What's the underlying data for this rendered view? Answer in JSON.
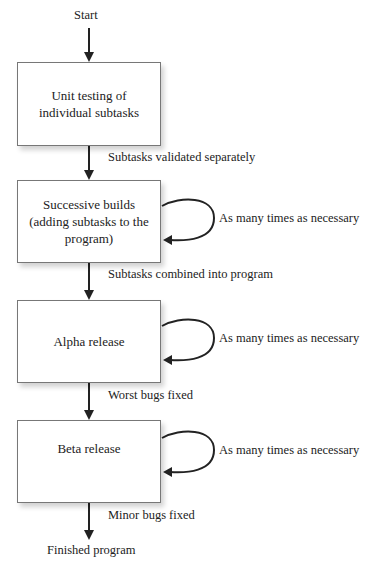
{
  "start_label": "Start",
  "end_label": "Finished program",
  "boxes": [
    {
      "text": "Unit testing of individual subtasks",
      "lines": [
        "Unit testing of",
        "individual subtasks"
      ]
    },
    {
      "text": "Successive builds (adding subtasks to the program)",
      "lines": [
        "Successive builds",
        "(adding subtasks to the",
        "program)"
      ]
    },
    {
      "text": "Alpha release",
      "lines": [
        "Alpha release"
      ]
    },
    {
      "text": "Beta release",
      "lines": [
        "Beta release"
      ]
    }
  ],
  "transitions": [
    "Subtasks validated separately",
    "Subtasks combined into program",
    "Worst bugs fixed",
    "Minor bugs fixed"
  ],
  "loop_label": "As many times as necessary",
  "loops": [
    {
      "box": 1,
      "label": "As many times as necessary"
    },
    {
      "box": 2,
      "label": "As many times as necessary"
    },
    {
      "box": 3,
      "label": "As many times as necessary"
    }
  ]
}
